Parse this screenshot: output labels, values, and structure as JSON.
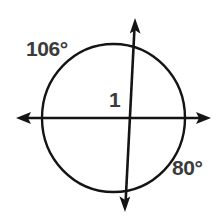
{
  "figure": {
    "background_color": "#ffffff",
    "stroke_color": "#111111",
    "text_color": "#3b3b3b",
    "labels": {
      "arc_upper_left": "106°",
      "arc_lower_right": "80°",
      "radius_or_segment": "1"
    },
    "shapes": {
      "circle": {
        "name": "circle",
        "center_x": 113.5,
        "center_y": 118,
        "radius_x": 71.5,
        "radius_y": 74
      },
      "horizontal_axis": {
        "name": "horizontal-axis",
        "x1": 16,
        "y1": 118,
        "x2": 211,
        "y2": 118,
        "arrowheads": "both"
      },
      "vertical_axis": {
        "name": "vertical-axis",
        "x1": 135,
        "y1": 18,
        "x2": 125,
        "y2": 212,
        "arrowheads": "both"
      },
      "intersection": {
        "x": 130,
        "y": 118
      }
    }
  }
}
